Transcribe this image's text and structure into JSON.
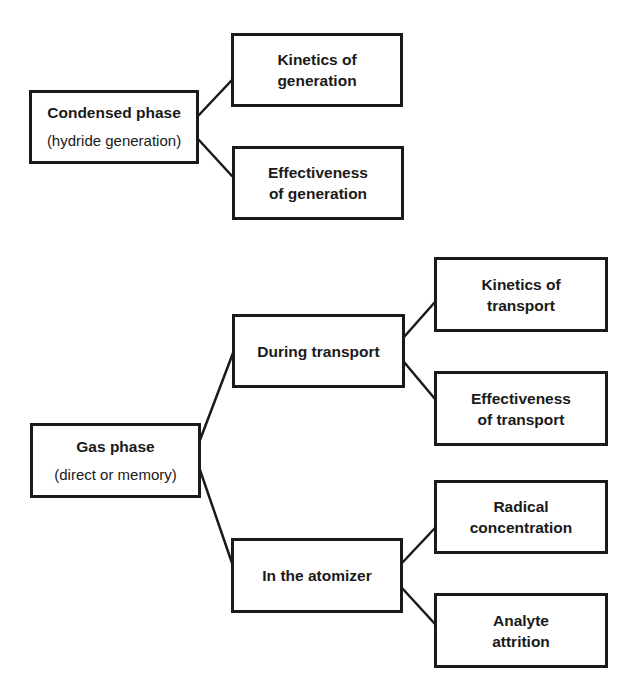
{
  "diagram": {
    "groups": [
      {
        "root": {
          "title": "Condensed phase",
          "subtitle": "(hydride generation)"
        },
        "children": [
          {
            "lines": [
              "Kinetics of",
              "generation"
            ]
          },
          {
            "lines": [
              "Effectiveness",
              "of generation"
            ]
          }
        ]
      },
      {
        "root": {
          "title": "Gas phase",
          "subtitle": "(direct or memory)"
        },
        "children": [
          {
            "label": "During transport",
            "children": [
              {
                "lines": [
                  "Kinetics of",
                  "transport"
                ]
              },
              {
                "lines": [
                  "Effectiveness",
                  "of transport"
                ]
              }
            ]
          },
          {
            "label": "In the atomizer",
            "children": [
              {
                "lines": [
                  "Radical",
                  "concentration"
                ]
              },
              {
                "lines": [
                  "Analyte",
                  "attrition"
                ]
              }
            ]
          }
        ]
      }
    ],
    "colors": {
      "stroke": "#1a1a1a",
      "background": "#ffffff"
    }
  }
}
